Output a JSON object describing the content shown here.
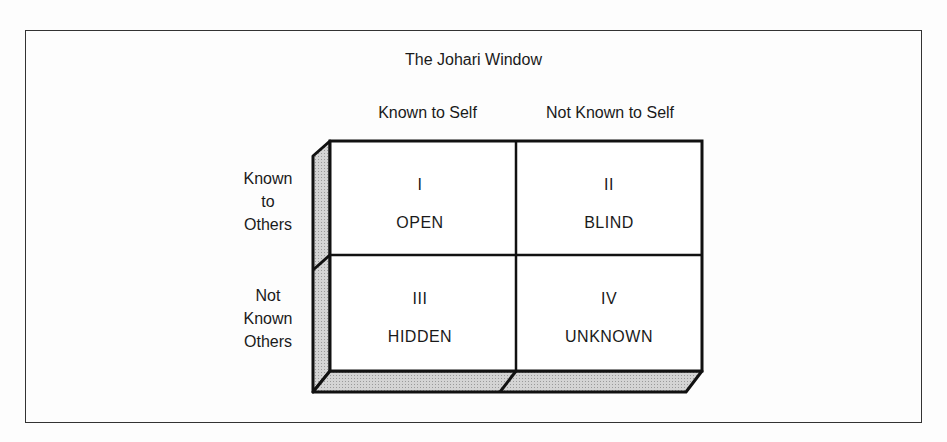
{
  "diagram": {
    "title": "The Johari Window",
    "columns": [
      "Known to Self",
      "Not Known to Self"
    ],
    "rows": [
      {
        "label_lines": [
          "Known",
          "to",
          "Others"
        ]
      },
      {
        "label_lines": [
          "Not",
          "Known",
          "Others"
        ]
      }
    ],
    "quadrants": [
      {
        "numeral": "I",
        "name": "OPEN"
      },
      {
        "numeral": "II",
        "name": "BLIND"
      },
      {
        "numeral": "III",
        "name": "HIDDEN"
      },
      {
        "numeral": "IV",
        "name": "UNKNOWN"
      }
    ],
    "colors": {
      "line": "#111111",
      "bevel": "#c8c8c8",
      "face": "#ffffff"
    }
  }
}
